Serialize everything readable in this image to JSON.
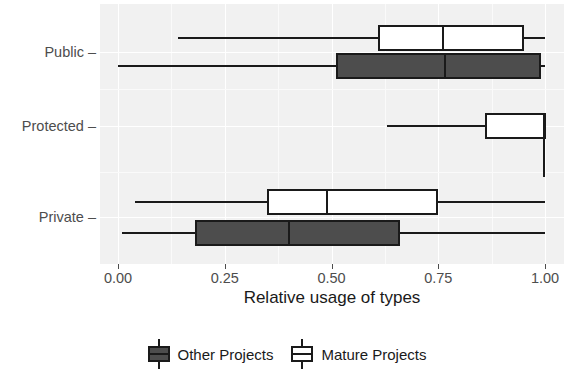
{
  "chart_data": {
    "type": "boxplot",
    "title": "",
    "xlabel": "Relative usage of types",
    "ylabel": "",
    "xlim": [
      0.0,
      1.0
    ],
    "xticks": [
      0.0,
      0.25,
      0.5,
      0.75,
      1.0
    ],
    "xtick_labels": [
      "0.00",
      "0.25",
      "0.50",
      "0.75",
      "1.00"
    ],
    "categories": [
      "Public",
      "Protected",
      "Private"
    ],
    "grid": true,
    "legend_position": "bottom",
    "series": [
      {
        "name": "Other Projects",
        "fill": "#4d4d4d",
        "boxes": [
          {
            "category": "Public",
            "whisker_low": 0.0,
            "q1": 0.51,
            "median": 0.765,
            "q3": 0.99,
            "whisker_high": 1.0
          },
          {
            "category": "Protected",
            "whisker_low": null,
            "q1": null,
            "median": null,
            "q3": null,
            "whisker_high": null
          },
          {
            "category": "Private",
            "whisker_low": 0.01,
            "q1": 0.18,
            "median": 0.4,
            "q3": 0.66,
            "whisker_high": 1.0
          }
        ]
      },
      {
        "name": "Mature Projects",
        "fill": "#ffffff",
        "boxes": [
          {
            "category": "Public",
            "whisker_low": 0.14,
            "q1": 0.61,
            "median": 0.76,
            "q3": 0.95,
            "whisker_high": 1.0
          },
          {
            "category": "Protected",
            "whisker_low": 0.63,
            "q1": 0.86,
            "median": 1.0,
            "q3": 1.0,
            "whisker_high": 1.0
          },
          {
            "category": "Private",
            "whisker_low": 0.04,
            "q1": 0.35,
            "median": 0.49,
            "q3": 0.75,
            "whisker_high": 1.0
          }
        ]
      }
    ]
  },
  "axis": {
    "x_title": "Relative usage of types",
    "x_tick_labels": [
      "0.00",
      "0.25",
      "0.50",
      "0.75",
      "1.00"
    ],
    "y_tick_labels": [
      "Public",
      "Protected",
      "Private"
    ]
  },
  "legend": {
    "entries": [
      {
        "label": "Other Projects",
        "swatch": "#4d4d4d"
      },
      {
        "label": "Mature Projects",
        "swatch": "#ffffff"
      }
    ]
  },
  "colors": {
    "panel_background": "#f1f1f1",
    "gridline": "#ffffff",
    "ink": "#1a1a1a",
    "axis_text": "#4d4d4d",
    "other_projects_fill": "#4d4d4d",
    "mature_projects_fill": "#ffffff"
  }
}
